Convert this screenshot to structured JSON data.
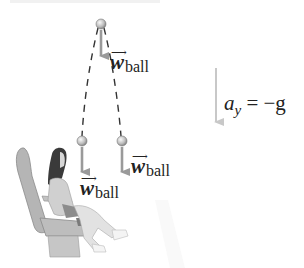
{
  "figure": {
    "labels": {
      "weight_top": {
        "symbol": "w",
        "subscript": "ball"
      },
      "weight_right": {
        "symbol": "w",
        "subscript": "ball"
      },
      "weight_left": {
        "symbol": "w",
        "subscript": "ball"
      },
      "acceleration": {
        "symbol": "a",
        "subscript": "y",
        "relation": "= −g"
      }
    },
    "vector_arrow_glyph": "⟶",
    "colors": {
      "arrow": "#9a9a9a",
      "ball_light": "#f2f2f2",
      "ball_dark": "#8e8e8e",
      "trajectory": "#333333",
      "accel_arrow": "#c4c4c4",
      "figure_gray": "#b8b8b8",
      "hair": "#3a3a3a"
    }
  }
}
